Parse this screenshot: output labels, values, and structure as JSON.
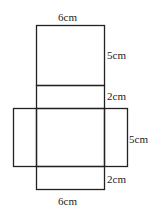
{
  "diagram": {
    "type": "net of cuboid",
    "labels": {
      "top_width": "6cm",
      "top_face_height": "5cm",
      "strip_height_1": "2cm",
      "middle_face_height": "5cm",
      "strip_height_2": "2cm",
      "bottom_width": "6cm"
    },
    "stroke_color": "#222222"
  }
}
